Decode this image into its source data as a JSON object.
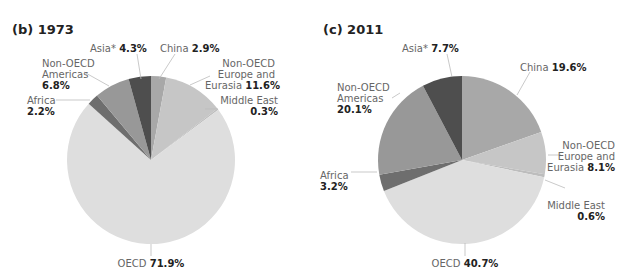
{
  "chart_data": [
    {
      "type": "pie",
      "title": "(b) 1973",
      "start_angle_deg": 0,
      "direction": "clockwise",
      "slices": [
        {
          "label": "China",
          "value": 2.9,
          "display": "2.9%",
          "color": "#a8a8a8"
        },
        {
          "label": "Non-OECD Europe and Eurasia",
          "value": 11.6,
          "display": "11.6%",
          "color": "#c6c6c6"
        },
        {
          "label": "Middle East",
          "value": 0.3,
          "display": "0.3%",
          "color": "#bdbdbd"
        },
        {
          "label": "OECD",
          "value": 71.9,
          "display": "71.9%",
          "color": "#dedede"
        },
        {
          "label": "Africa",
          "value": 2.2,
          "display": "2.2%",
          "color": "#6e6e6e"
        },
        {
          "label": "Non-OECD Americas",
          "value": 6.8,
          "display": "6.8%",
          "color": "#989898"
        },
        {
          "label": "Asia*",
          "value": 4.3,
          "display": "4.3%",
          "color": "#4e4e4e"
        }
      ]
    },
    {
      "type": "pie",
      "title": "(c) 2011",
      "start_angle_deg": 0,
      "direction": "clockwise",
      "slices": [
        {
          "label": "China",
          "value": 19.6,
          "display": "19.6%",
          "color": "#a8a8a8"
        },
        {
          "label": "Non-OECD Europe and Eurasia",
          "value": 8.1,
          "display": "8.1%",
          "color": "#c6c6c6"
        },
        {
          "label": "Middle East",
          "value": 0.6,
          "display": "0.6%",
          "color": "#bdbdbd"
        },
        {
          "label": "OECD",
          "value": 40.7,
          "display": "40.7%",
          "color": "#dedede"
        },
        {
          "label": "Africa",
          "value": 3.2,
          "display": "3.2%",
          "color": "#6e6e6e"
        },
        {
          "label": "Non-OECD Americas",
          "value": 20.1,
          "display": "20.1%",
          "color": "#989898"
        },
        {
          "label": "Asia*",
          "value": 7.7,
          "display": "7.7%",
          "color": "#4e4e4e"
        }
      ]
    }
  ],
  "labels": {
    "p1": {
      "title": "(b) 1973",
      "asia_name": "Asia*",
      "asia_val": "4.3%",
      "china_name": "China",
      "china_val": "2.9%",
      "amer_l1": "Non-OECD",
      "amer_l2": "Americas",
      "amer_val": "6.8%",
      "eur_l1": "Non-OECD",
      "eur_l2": "Europe and",
      "eur_l3": "Eurasia",
      "eur_val": "11.6%",
      "africa_name": "Africa",
      "africa_val": "2.2%",
      "me_name": "Middle East",
      "me_val": "0.3%",
      "oecd_name": "OECD",
      "oecd_val": "71.9%"
    },
    "p2": {
      "title": "(c) 2011",
      "asia_name": "Asia*",
      "asia_val": "7.7%",
      "china_name": "China",
      "china_val": "19.6%",
      "amer_l1": "Non-OECD",
      "amer_l2": "Americas",
      "amer_val": "20.1%",
      "eur_l1": "Non-OECD",
      "eur_l2": "Europe and",
      "eur_l3": "Eurasia",
      "eur_val": "8.1%",
      "africa_name": "Africa",
      "africa_val": "3.2%",
      "me_name": "Middle East",
      "me_val": "0.6%",
      "oecd_name": "OECD",
      "oecd_val": "40.7%"
    }
  }
}
